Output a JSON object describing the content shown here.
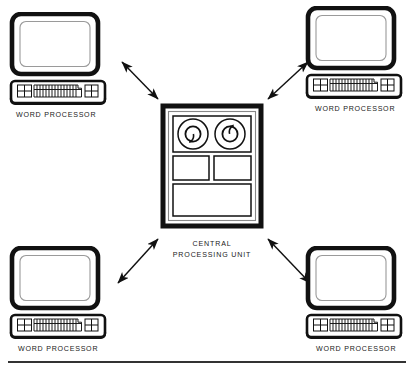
{
  "diagram": {
    "type": "network-topology",
    "colors": {
      "line": "#111111",
      "fill": "#ffffff",
      "text": "#1a1a1a",
      "rule": "#333333"
    },
    "central_node": {
      "name": "central-processing-unit",
      "label_line_1": "CENTRAL",
      "label_line_2": "PROCESSING UNIT",
      "icon": "mainframe-cabinet-icon",
      "components": [
        {
          "name": "tape-reel-left",
          "icon": "tape-reel-icon"
        },
        {
          "name": "tape-reel-right",
          "icon": "tape-reel-icon"
        },
        {
          "name": "panel-left",
          "icon": "blank-panel-icon"
        },
        {
          "name": "panel-right",
          "icon": "blank-panel-icon"
        },
        {
          "name": "panel-lower",
          "icon": "blank-panel-icon"
        }
      ]
    },
    "terminals": [
      {
        "position": "top-left",
        "name": "word-processor-top-left",
        "label": "WORD PROCESSOR",
        "icon": "crt-terminal-icon"
      },
      {
        "position": "top-right",
        "name": "word-processor-top-right",
        "label": "WORD PROCESSOR",
        "icon": "crt-terminal-icon"
      },
      {
        "position": "bottom-left",
        "name": "word-processor-bottom-left",
        "label": "WORD PROCESSOR",
        "icon": "crt-terminal-icon"
      },
      {
        "position": "bottom-right",
        "name": "word-processor-bottom-right",
        "label": "WORD PROCESSOR",
        "icon": "crt-terminal-icon"
      }
    ],
    "connections": [
      {
        "name": "link-top-left",
        "from": "word-processor-top-left",
        "to": "central-processing-unit",
        "style": "double-headed-arrow"
      },
      {
        "name": "link-top-right",
        "from": "word-processor-top-right",
        "to": "central-processing-unit",
        "style": "double-headed-arrow"
      },
      {
        "name": "link-bottom-left",
        "from": "word-processor-bottom-left",
        "to": "central-processing-unit",
        "style": "double-headed-arrow"
      },
      {
        "name": "link-bottom-right",
        "from": "word-processor-bottom-right",
        "to": "central-processing-unit",
        "style": "double-headed-arrow"
      }
    ],
    "footer_rule": {
      "name": "footer-divider",
      "visible": true
    }
  }
}
